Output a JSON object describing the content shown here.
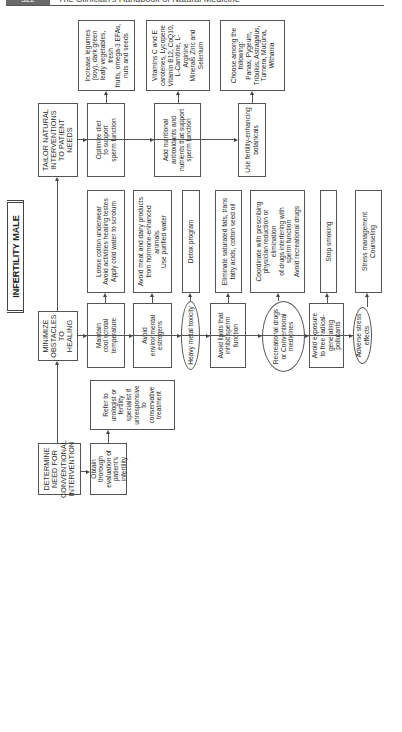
{
  "page_header": {
    "page_number": "322",
    "book_title": "The Clinician's Handbook of Natural Medicine"
  },
  "diagram": {
    "title": "INFERTILITY MALE",
    "nodes": {
      "determine": "DETERMINE\nNEED FOR\nCONVENTIONAL\nINTERVENTION",
      "obtain": "Obtain thorough\nevaluation of\npatient's infertility",
      "refer": "Refer to\nurologist or\nfertility\nspecialist if\nunresponsive\nto\nconservative\ntreatment",
      "minimize": "MINIMIZE\nOBSTACLES\nTO HEALING",
      "maintain": "Maintain\ncool scrotal\ntemperature",
      "maintain_action": "Loose cotton underwear\nAvoid activities heating testes\nApply cold water to scrotum",
      "estrogens": "Avoid\nenvironmental\nestrogens",
      "estrogens_action": "Avoid meat and dairy products\nfrom hormone-enhanced animals.\nUse purified water",
      "heavy_metal": "Heavy metal toxicity",
      "heavy_metal_action": "Detox program",
      "lipids": "Avoid lipids that\ninhibit sperm\nfunction",
      "lipids_action": "Eliminate saturated fats, trans\nfatty acids, cotton seed oil",
      "drugs": "Recreational drugs\nor Conventional\nmedicines",
      "drugs_action": "Coordinate with prescribing\nphysician reduction or elimination\nof drugs interfering with\nsperm function\nAvoid recreational drugs",
      "pollutants": "Avoid exposure\nto free radical-\ngenerating pollutants",
      "pollutants_action": "Stop smoking",
      "stress": "Adverse stress\neffects",
      "stress_action": "Stress management\nCounseling",
      "tailor": "TAILOR NATURAL\nINTERVENTIONS\nTO PATIENT NEEDS",
      "diet": "Optimize diet\nto support\nsperm function",
      "diet_action": "Increase legumes\n(soy), dark green\nleafy vegetables, fresh\nfruits, omega-3 EFAs,\nnuts and seeds",
      "antioxidants": "Add nutritional\nantioxidants and\nnutrients that support\nsperm function",
      "antioxidants_action": "Vitamins C and E\ncarotenes, Lycopene\nVitamin B12, CoQ10,\nL-Carnitine, L-Arginine\nMinerals Zinc and\nSelenium",
      "botanicals": "Use fertility-enhancing\nbotanicals",
      "botanicals_action": "Choose among the\nfollowing:\nPanax, Pygeum,\nTribulus, Astragalus,\nTurnera, Mucuna,\nWithania"
    }
  }
}
